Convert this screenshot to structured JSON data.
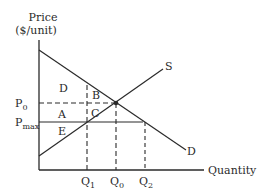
{
  "diagram": {
    "y_axis_label_line1": "Price",
    "y_axis_label_line2": "($/unit)",
    "x_axis_label": "Quantity",
    "price_labels": {
      "p0": "P",
      "p0_sub": "0",
      "pmax": "P",
      "pmax_sub": "max"
    },
    "quantity_labels": {
      "q1": "Q",
      "q1_sub": "1",
      "q0": "Q",
      "q0_sub": "0",
      "q2": "Q",
      "q2_sub": "2"
    },
    "curves": {
      "supply": "S",
      "demand": "D"
    },
    "regions": {
      "a": "A",
      "b": "B",
      "c": "C",
      "d": "D",
      "e": "E"
    },
    "colors": {
      "line": "#2a2a2a",
      "background": "#ffffff"
    }
  }
}
